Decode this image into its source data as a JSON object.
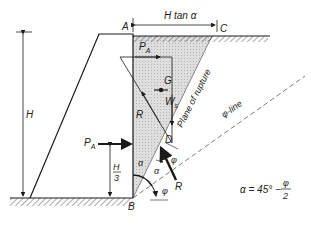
{
  "diagram": {
    "labels": {
      "A": "A",
      "B": "B",
      "C": "C",
      "D": "D",
      "G": "G",
      "H": "H",
      "H_tan_alpha": "H tan α",
      "P_A_top": "P",
      "P_A_top_sub": "A",
      "P_A_left": "P",
      "P_A_left_sub": "A",
      "W": "W",
      "W_sub": "s",
      "R_upper": "R",
      "R_lower": "R",
      "H3_num": "H",
      "H3_den": "3",
      "alpha1": "α",
      "alpha2": "α",
      "phi1": "φ",
      "phi2": "φ",
      "plane_of_rupture": "Plane of rupture",
      "phi_line": "φ-line",
      "formula_lhs": "α = 45° −",
      "formula_num": "φ",
      "formula_den": "2"
    },
    "colors": {
      "line": "#1a1a1a",
      "shade": "#d4d4d4",
      "hatch": "#555555"
    }
  }
}
